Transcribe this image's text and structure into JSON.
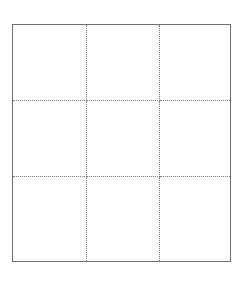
{
  "grid": {
    "rows": 3,
    "columns": 3,
    "cells": [
      {
        "row": 0,
        "col": 0,
        "content": ""
      },
      {
        "row": 0,
        "col": 1,
        "content": ""
      },
      {
        "row": 0,
        "col": 2,
        "content": ""
      },
      {
        "row": 1,
        "col": 0,
        "content": ""
      },
      {
        "row": 1,
        "col": 1,
        "content": ""
      },
      {
        "row": 1,
        "col": 2,
        "content": ""
      },
      {
        "row": 2,
        "col": 0,
        "content": ""
      },
      {
        "row": 2,
        "col": 1,
        "content": ""
      },
      {
        "row": 2,
        "col": 2,
        "content": ""
      }
    ],
    "colors": {
      "border": "#6f6f6f",
      "divider": "#7a7a7a",
      "background": "#ffffff"
    }
  }
}
